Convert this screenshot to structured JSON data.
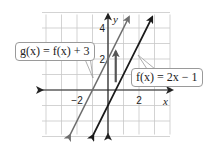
{
  "diagram": {
    "type": "function-graph",
    "grid": {
      "x_min": -4,
      "x_max": 4,
      "y_min": -3,
      "y_max": 5,
      "step": 1
    },
    "axes": {
      "x_label": "x",
      "y_label": "y"
    },
    "ticks": {
      "x": [
        {
          "value": -2,
          "label": "−2"
        },
        {
          "value": 2,
          "label": "2"
        }
      ],
      "y": [
        {
          "value": 2,
          "label": "2"
        },
        {
          "value": 4,
          "label": "4"
        }
      ]
    },
    "lines": [
      {
        "name": "f",
        "slope": 2,
        "intercept": -1,
        "color": "#1a1a1a",
        "label": "f(x) = 2x − 1"
      },
      {
        "name": "g",
        "slope": 2,
        "intercept": 2,
        "color": "#6e6e6e",
        "label": "g(x) = f(x) + 3"
      }
    ],
    "shift_arrow": {
      "x": 0.5,
      "from_y": 0.5,
      "to_y": 2.5,
      "color": "#555555"
    },
    "callouts": {
      "g_label": "g(x) = f(x) + 3",
      "f_label": "f(x) = 2x − 1"
    }
  }
}
